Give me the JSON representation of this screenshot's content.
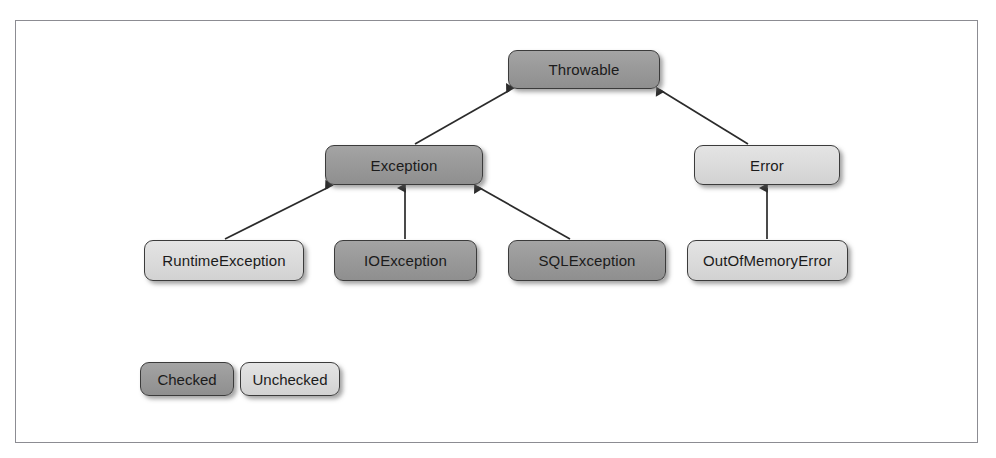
{
  "figure": {
    "caption": "",
    "background_color": "#ffffff",
    "frame_color": "#8c8c92"
  },
  "colors": {
    "checked_fill": "#9a9a9a",
    "unchecked_fill": "#dcdcdc",
    "node_border": "#3b3b3b",
    "edge": "#2b2b2b",
    "text": "#1b1b1b"
  },
  "diagram": {
    "type": "class-hierarchy",
    "nodes": [
      {
        "id": "throwable",
        "label": "Throwable",
        "kind": "checked",
        "level": 0
      },
      {
        "id": "exception",
        "label": "Exception",
        "kind": "checked",
        "level": 1
      },
      {
        "id": "error",
        "label": "Error",
        "kind": "unchecked",
        "level": 1
      },
      {
        "id": "runtimeexception",
        "label": "RuntimeException",
        "kind": "unchecked",
        "level": 2
      },
      {
        "id": "ioexception",
        "label": "IOException",
        "kind": "checked",
        "level": 2
      },
      {
        "id": "sqlexception",
        "label": "SQLException",
        "kind": "checked",
        "level": 2
      },
      {
        "id": "outofmemoryerror",
        "label": "OutOfMemoryError",
        "kind": "unchecked",
        "level": 2
      }
    ],
    "edges": [
      {
        "from": "exception",
        "to": "throwable",
        "relation": "extends"
      },
      {
        "from": "error",
        "to": "throwable",
        "relation": "extends"
      },
      {
        "from": "runtimeexception",
        "to": "exception",
        "relation": "extends"
      },
      {
        "from": "ioexception",
        "to": "exception",
        "relation": "extends"
      },
      {
        "from": "sqlexception",
        "to": "exception",
        "relation": "extends"
      },
      {
        "from": "outofmemoryerror",
        "to": "error",
        "relation": "extends"
      }
    ]
  },
  "legend": {
    "items": [
      {
        "label": "Checked",
        "kind": "checked"
      },
      {
        "label": "Unchecked",
        "kind": "unchecked"
      }
    ]
  }
}
